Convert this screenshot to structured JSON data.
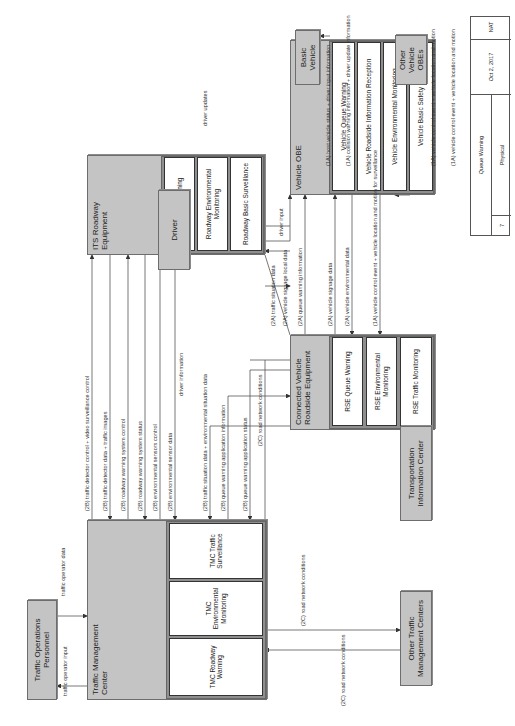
{
  "diagram": {
    "orientation": "rotated 90 degrees counter-clockwise",
    "nodes": {
      "traffic_operations_personnel": "Traffic Operations Personnel",
      "traffic_management_center": "Traffic Management Center",
      "tmc_roadway_warning": "TMC Roadway Warning",
      "tmc_environmental_monitoring": "TMC Environmental Monitoring",
      "tmc_traffic_surveillance": "TMC Traffic Surveillance",
      "its_roadway_equipment": "ITS Roadway Equipment",
      "roadway_warning": "Roadway Warning",
      "roadway_environmental_monitoring": "Roadway Environmental Monitoring",
      "roadway_basic_surveillance": "Roadway Basic Surveillance",
      "driver": "Driver",
      "connected_vehicle_roadside_equipment": "Connected Vehicle Roadside Equipment",
      "rse_queue_warning": "RSE Queue Warning",
      "rse_environmental_monitoring": "RSE Environmental Monitoring",
      "rse_traffic_monitoring": "RSE Traffic Monitoring",
      "vehicle_obe": "Vehicle OBE",
      "vehicle_queue_warning": "Vehicle Queue Warning",
      "vehicle_roadside_information_reception": "Vehicle Roadside Information Reception",
      "vehicle_environmental_monitoring": "Vehicle Environmental Monitoring",
      "vehicle_basic_safety": "Vehicle Basic Safety",
      "basic_vehicle": "Basic Vehicle",
      "other_vehicle_obes": "Other Vehicle OBEs",
      "transportation_information_center": "Transportation Information Center",
      "other_traffic_management_centers": "Other Traffic Management Centers"
    },
    "flows": {
      "traffic_operator_data": "traffic operator data",
      "traffic_operator_input": "traffic operator input",
      "f2b_detector_control": "(2B) traffic detector control + video surveillance control",
      "f2b_detector_data": "(2B) traffic detector data + traffic images",
      "f2b_rw_system_control": "(2B) roadway warning system control",
      "f2b_rw_system_status": "(2B) roadway warning system status",
      "f2b_env_sensors_control": "(2B) environmental sensors control",
      "f2b_env_sensor_data": "(2B) environmental sensor data",
      "f2b_traffic_situation": "(2B) traffic situation data + environmental situation data",
      "f2b_qw_app_info": "(2B) queue warning application information",
      "f2b_qw_app_status": "(2B) queue warning application status",
      "f2c_road_network_tic": "(2C) road network conditions",
      "f2c_road_network_out": "(2C) road network conditions",
      "f2c_road_network_in": "(2C) road network conditions",
      "f2a_traffic_situation": "(2A) traffic situation data",
      "f2a_signage_local": "(2A) vehicle signage local data",
      "driver_information": "driver information",
      "driver_input": "driver input",
      "driver_updates": "driver updates",
      "f2a_queue_warning_info": "(2A) queue warning information",
      "f2a_vehicle_signage": "(2A) vehicle signage data",
      "f2a_vehicle_env": "(2A) vehicle environmental data",
      "f1a_vc_event_surv": "(1A) vehicle control event + vehicle location and motion for surveillance",
      "f1a_host_status": "(1A) host vehicle status + driver input information",
      "f1a_collision": "(1A) collision warning information + driver update information",
      "f1a_vc_event_out": "(1A) vehicle control event + vehicle location and motion",
      "f1a_vc_event_in": "(1A) vehicle control event + vehicle location and motion"
    },
    "legend": {
      "number": "7",
      "title": "Queue Warning",
      "view": "Physical",
      "date": "Oct 2, 2017",
      "author": "NAT"
    }
  }
}
